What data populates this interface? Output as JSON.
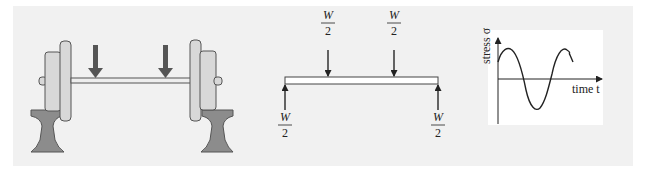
{
  "figure": {
    "panel_color": "#f1f1f1",
    "axle_illustration": {
      "description": "Railway wheelset resting on two rails with two downward load arrows on the axle",
      "wheel_color": "#d8d8d8",
      "rail_color": "#8c8c8c",
      "load_arrow_color": "#555555",
      "load_arrow_count": 2
    },
    "beam_diagram": {
      "loads": [
        {
          "id": "load-left",
          "direction": "down",
          "numerator": "W",
          "denominator": "2"
        },
        {
          "id": "load-right",
          "direction": "down",
          "numerator": "W",
          "denominator": "2"
        }
      ],
      "reactions": [
        {
          "id": "reaction-left",
          "direction": "up",
          "numerator": "W",
          "denominator": "2"
        },
        {
          "id": "reaction-right",
          "direction": "up",
          "numerator": "W",
          "denominator": "2"
        }
      ]
    },
    "stress_graph": {
      "y_label": "stress σ",
      "x_label": "time t",
      "curve": "sinusoid"
    }
  }
}
